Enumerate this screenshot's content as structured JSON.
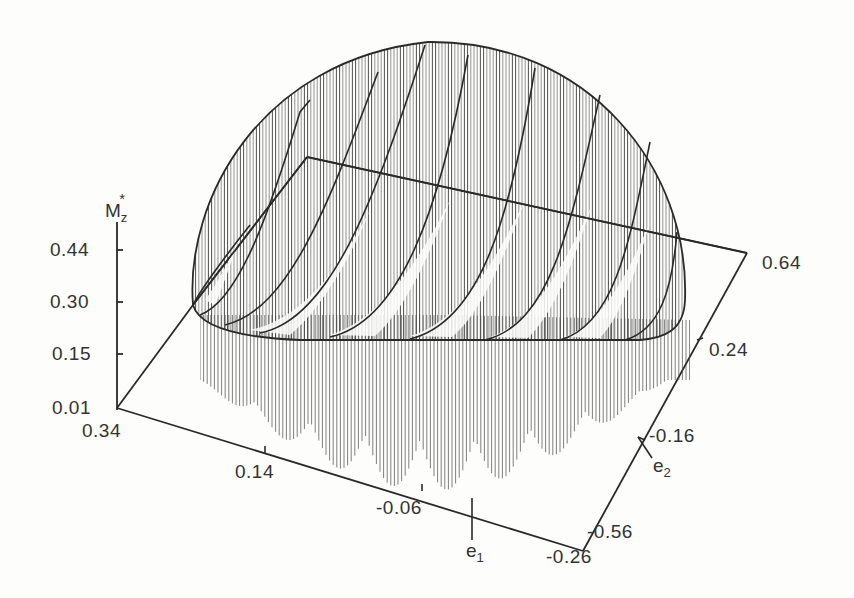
{
  "chart_data": {
    "type": "surface3d",
    "title": "",
    "zlabel": "M_z*",
    "xlabel": "e_1",
    "ylabel": "e_2",
    "z_ticks": [
      "0.44",
      "0.30",
      "0.15",
      "0.01"
    ],
    "x_ticks": [
      "0.34",
      "0.14",
      "-0.06",
      "-0.26"
    ],
    "y_ticks": [
      "-0.56",
      "-0.16",
      "0.24",
      "0.64"
    ],
    "x_range": [
      -0.26,
      0.34
    ],
    "y_range": [
      -0.56,
      0.64
    ],
    "z_range": [
      0.01,
      0.44
    ],
    "section_curves": 9,
    "grid": false
  },
  "labels": {
    "z_axis_main": "M",
    "z_axis_sub": "z",
    "z_axis_sup": "*",
    "e1_main": "e",
    "e1_sub": "1",
    "e2_main": "e",
    "e2_sub": "2",
    "z_ticks": {
      "t0": "0.44",
      "t1": "0.30",
      "t2": "0.15",
      "t3": "0.01"
    },
    "x_ticks": {
      "t0": "0.34",
      "t1": "0.14",
      "t2": "-0.06",
      "t3": "-0.26"
    },
    "y_ticks": {
      "t0": "-0.56",
      "t1": "-0.16",
      "t2": "0.24",
      "t3": "0.64"
    }
  },
  "colors": {
    "ink": "#2a2a2a",
    "paper": "#fdfdfb",
    "hatch": "#555555"
  }
}
